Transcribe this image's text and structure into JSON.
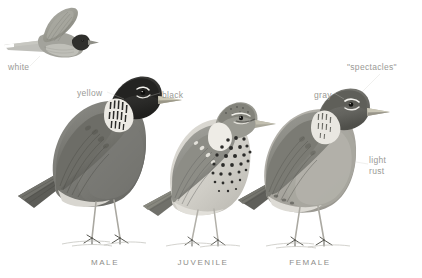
{
  "plate": {
    "background_color": "#ffffff",
    "subject": "American Robin plumage comparison plate",
    "label_color": "#9a9a96",
    "caption_color": "#8e8e8a",
    "ink_color": "#4a4a48"
  },
  "annotations": [
    {
      "id": "white",
      "text": "white",
      "x": 8,
      "y": 62,
      "points_to": "flying-bird-tail-corners"
    },
    {
      "id": "yellow",
      "text": "yellow",
      "x": 77,
      "y": 88,
      "points_to": "male-bill"
    },
    {
      "id": "black",
      "text": "black",
      "x": 162,
      "y": 90,
      "points_to": "male-head"
    },
    {
      "id": "gray",
      "text": "gray",
      "x": 314,
      "y": 90,
      "points_to": "female-head"
    },
    {
      "id": "spectacles",
      "text": "\"spectacles\"",
      "x": 347,
      "y": 62,
      "points_to": "female-eye-ring"
    },
    {
      "id": "light-rust",
      "text": "light\nrust",
      "x": 369,
      "y": 155,
      "points_to": "female-breast"
    }
  ],
  "captions": [
    {
      "id": "male",
      "text": "MALE",
      "center_x": 105
    },
    {
      "id": "juvenile",
      "text": "JUVENILE",
      "center_x": 203
    },
    {
      "id": "female",
      "text": "FEMALE",
      "center_x": 310
    }
  ],
  "figures": [
    {
      "id": "flying-bird",
      "label": "robin in flight",
      "plumage": "male",
      "x": 22,
      "y": 6
    },
    {
      "id": "male-bird",
      "label": "perched male robin",
      "plumage": "male",
      "x": 40,
      "y": 62
    },
    {
      "id": "juvenile-bird",
      "label": "perched juvenile robin",
      "plumage": "juvenile",
      "x": 160,
      "y": 84
    },
    {
      "id": "female-bird",
      "label": "perched female robin",
      "plumage": "female",
      "x": 255,
      "y": 84
    }
  ]
}
